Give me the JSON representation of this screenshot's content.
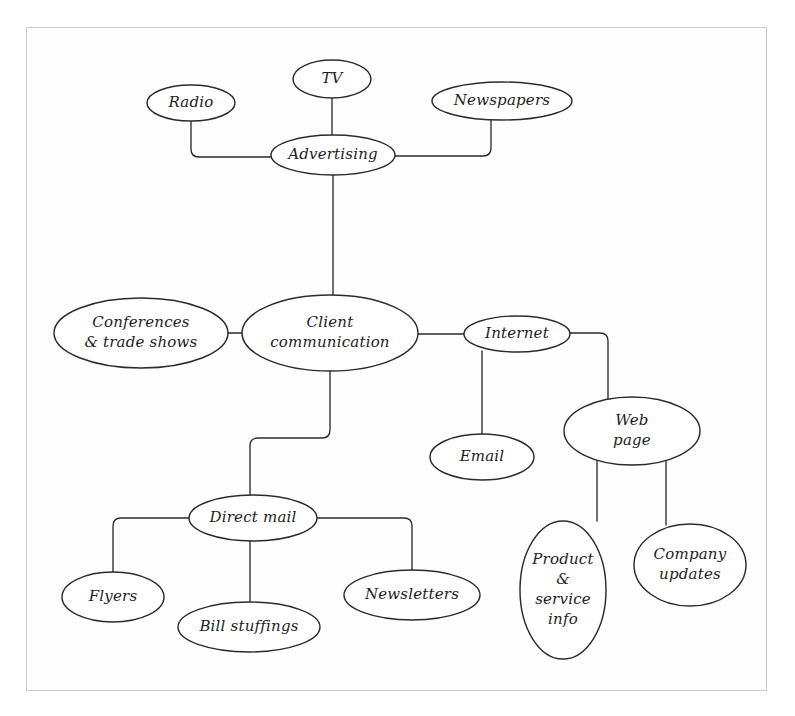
{
  "diagram": {
    "type": "mind-map",
    "frame": {
      "x": 26,
      "y": 27,
      "width": 741,
      "height": 664,
      "border_color": "#c9c9c9"
    },
    "style": {
      "node_fill": "#ffffff",
      "node_stroke": "#2b2b2b",
      "connector_stroke": "#2b2b2b",
      "text_color": "#1d1d1d",
      "background": "#ffffff"
    },
    "nodes": [
      {
        "id": "tv",
        "label": "TV",
        "lines": [
          "TV"
        ],
        "cx": 332,
        "cy": 79,
        "rx": 39,
        "ry": 19,
        "font_size": 15
      },
      {
        "id": "radio",
        "label": "Radio",
        "lines": [
          "Radio"
        ],
        "cx": 191,
        "cy": 103,
        "rx": 44,
        "ry": 18,
        "font_size": 15
      },
      {
        "id": "newspapers",
        "label": "Newspapers",
        "lines": [
          "Newspapers"
        ],
        "cx": 502,
        "cy": 101,
        "rx": 70,
        "ry": 19,
        "font_size": 15
      },
      {
        "id": "advertising",
        "label": "Advertising",
        "lines": [
          "Advertising"
        ],
        "cx": 333,
        "cy": 155,
        "rx": 62,
        "ry": 20,
        "font_size": 15
      },
      {
        "id": "conferences",
        "label": "Conferences & trade shows",
        "lines": [
          "Conferences",
          "& trade shows"
        ],
        "cx": 141,
        "cy": 333,
        "rx": 87,
        "ry": 35,
        "font_size": 15
      },
      {
        "id": "client-communication",
        "label": "Client communication",
        "lines": [
          "Client",
          "communication"
        ],
        "cx": 330,
        "cy": 333,
        "rx": 88,
        "ry": 38,
        "font_size": 15
      },
      {
        "id": "internet",
        "label": "Internet",
        "lines": [
          "Internet"
        ],
        "cx": 517,
        "cy": 334,
        "rx": 53,
        "ry": 18,
        "font_size": 15
      },
      {
        "id": "email",
        "label": "Email",
        "lines": [
          "Email"
        ],
        "cx": 482,
        "cy": 457,
        "rx": 52,
        "ry": 23,
        "font_size": 15
      },
      {
        "id": "web-page",
        "label": "Web page",
        "lines": [
          "Web",
          "page"
        ],
        "cx": 632,
        "cy": 431,
        "rx": 68,
        "ry": 34,
        "font_size": 15
      },
      {
        "id": "direct-mail",
        "label": "Direct mail",
        "lines": [
          "Direct mail"
        ],
        "cx": 253,
        "cy": 518,
        "rx": 64,
        "ry": 23,
        "font_size": 15
      },
      {
        "id": "flyers",
        "label": "Flyers",
        "lines": [
          "Flyers"
        ],
        "cx": 113,
        "cy": 597,
        "rx": 51,
        "ry": 25,
        "font_size": 15
      },
      {
        "id": "bill-stuffings",
        "label": "Bill stuffings",
        "lines": [
          "Bill stuffings"
        ],
        "cx": 249,
        "cy": 627,
        "rx": 71,
        "ry": 25,
        "font_size": 15
      },
      {
        "id": "newsletters",
        "label": "Newsletters",
        "lines": [
          "Newsletters"
        ],
        "cx": 412,
        "cy": 595,
        "rx": 68,
        "ry": 25,
        "font_size": 15
      },
      {
        "id": "product-service-info",
        "label": "Product & service info",
        "lines": [
          "Product",
          "&",
          "service",
          "info"
        ],
        "cx": 563,
        "cy": 590,
        "rx": 43,
        "ry": 69,
        "font_size": 15
      },
      {
        "id": "company-updates",
        "label": "Company updates",
        "lines": [
          "Company",
          "updates"
        ],
        "cx": 690,
        "cy": 565,
        "rx": 56,
        "ry": 41,
        "font_size": 15
      }
    ],
    "connections": [
      {
        "id": "advertising-tv",
        "from": "advertising",
        "to": "tv",
        "path": "M 332 98 L 332 135"
      },
      {
        "id": "advertising-radio",
        "from": "advertising",
        "to": "radio",
        "path": "M 191 121 L 191 149 Q 191 157 199 157 L 271 157"
      },
      {
        "id": "advertising-newspapers",
        "from": "advertising",
        "to": "newspapers",
        "path": "M 395 156 L 483 156 Q 491 156 491 148 L 491 120"
      },
      {
        "id": "advertising-client",
        "from": "advertising",
        "to": "client-communication",
        "path": "M 333 175 L 333 295"
      },
      {
        "id": "client-conferences",
        "from": "client-communication",
        "to": "conferences",
        "path": "M 228 333 L 242 333"
      },
      {
        "id": "client-internet",
        "from": "client-communication",
        "to": "internet",
        "path": "M 418 334 L 464 334"
      },
      {
        "id": "internet-email",
        "from": "internet",
        "to": "email",
        "path": "M 482 351 L 482 434"
      },
      {
        "id": "internet-webpage",
        "from": "internet",
        "to": "web-page",
        "path": "M 570 333 L 600 333 Q 608 333 608 341 L 608 400"
      },
      {
        "id": "webpage-product",
        "from": "web-page",
        "to": "product-service-info",
        "path": "M 597 460 L 597 521"
      },
      {
        "id": "webpage-company",
        "from": "web-page",
        "to": "company-updates",
        "path": "M 666 459 L 666 525"
      },
      {
        "id": "client-directmail",
        "from": "client-communication",
        "to": "direct-mail",
        "path": "M 330 371 L 330 430 Q 330 438 322 438 L 258 438 Q 250 438 250 446 L 250 495"
      },
      {
        "id": "directmail-flyers",
        "from": "direct-mail",
        "to": "flyers",
        "path": "M 189 518 L 121 518 Q 113 518 113 526 L 113 572"
      },
      {
        "id": "directmail-bill",
        "from": "direct-mail",
        "to": "bill-stuffings",
        "path": "M 250 541 L 250 602"
      },
      {
        "id": "directmail-newsletters",
        "from": "direct-mail",
        "to": "newsletters",
        "path": "M 317 518 L 404 518 Q 412 518 412 526 L 412 570"
      }
    ]
  }
}
